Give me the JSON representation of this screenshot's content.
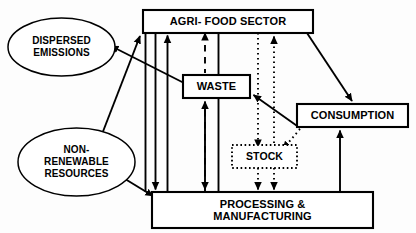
{
  "diagram": {
    "stroke_color": "#000000",
    "fill_color": "#ffffff",
    "nodes": [
      {
        "id": "agri_food",
        "label": "AGRI- FOOD SECTOR",
        "shape": "rect",
        "border": "solid",
        "x": 143,
        "y": 10,
        "w": 170,
        "h": 23
      },
      {
        "id": "waste",
        "label": "WASTE",
        "shape": "rect",
        "border": "solid",
        "x": 183,
        "y": 75,
        "w": 67,
        "h": 23
      },
      {
        "id": "stock",
        "label": "STOCK",
        "shape": "rect",
        "border": "dotted",
        "x": 232,
        "y": 145,
        "w": 65,
        "h": 23
      },
      {
        "id": "consumption",
        "label": "CONSUMPTION",
        "shape": "rect",
        "border": "solid",
        "x": 297,
        "y": 104,
        "w": 111,
        "h": 23
      },
      {
        "id": "processing",
        "label": "PROCESSING &\nMANUFACTURING",
        "shape": "rect",
        "border": "solid",
        "x": 152,
        "y": 192,
        "w": 221,
        "h": 36
      },
      {
        "id": "dispersed",
        "label": "DISPERSED\nEMISSIONS",
        "shape": "ellipse",
        "border": "solid",
        "x": 8,
        "y": 18,
        "w": 107,
        "h": 58
      },
      {
        "id": "nonrenew",
        "label": "NON-\nRENEWABLE\nRESOURCES",
        "shape": "ellipse",
        "border": "solid",
        "x": 18,
        "y": 128,
        "w": 117,
        "h": 68
      }
    ],
    "node_labels": {
      "agri_food": "AGRI- FOOD SECTOR",
      "waste": "WASTE",
      "stock": "STOCK",
      "consumption": "CONSUMPTION",
      "processing_line1": "PROCESSING &",
      "processing_line2": "MANUFACTURING",
      "dispersed_line1": "DISPERSED",
      "dispersed_line2": "EMISSIONS",
      "nonrenew_line1": "NON-",
      "nonrenew_line2": "RENEWABLE",
      "nonrenew_line3": "RESOURCES"
    },
    "edges": [
      {
        "id": "e1",
        "from": "agri_food",
        "to": "waste",
        "style": "solid",
        "arrow": "end"
      },
      {
        "id": "e2",
        "from": "agri_food",
        "to": "consumption",
        "style": "solid",
        "arrow": "end"
      },
      {
        "id": "e3",
        "from": "agri_food",
        "to": "processing",
        "style": "solid",
        "arrow": "end"
      },
      {
        "id": "e4",
        "from": "processing",
        "to": "agri_food",
        "style": "solid",
        "arrow": "end"
      },
      {
        "id": "e5",
        "from": "processing",
        "to": "agri_food",
        "style": "dashed",
        "arrow": "both"
      },
      {
        "id": "e6",
        "from": "waste",
        "to": "processing",
        "style": "dotted",
        "arrow": "end"
      },
      {
        "id": "e7",
        "from": "stock",
        "to": "agri_food",
        "style": "dotted",
        "arrow": "end"
      },
      {
        "id": "e8",
        "from": "processing",
        "to": "waste",
        "style": "solid",
        "arrow": "end"
      },
      {
        "id": "e9",
        "from": "processing",
        "to": "consumption",
        "style": "solid",
        "arrow": "end"
      },
      {
        "id": "e10",
        "from": "consumption",
        "to": "waste",
        "style": "solid",
        "arrow": "end"
      },
      {
        "id": "e11",
        "from": "consumption",
        "to": "stock",
        "style": "dotted",
        "arrow": "end"
      },
      {
        "id": "e12",
        "from": "stock",
        "to": "processing",
        "style": "dotted",
        "arrow": "end"
      },
      {
        "id": "e13",
        "from": "waste",
        "to": "dispersed",
        "style": "solid",
        "arrow": "end"
      },
      {
        "id": "e14",
        "from": "nonrenew",
        "to": "agri_food",
        "style": "solid",
        "arrow": "end"
      },
      {
        "id": "e15",
        "from": "nonrenew",
        "to": "processing",
        "style": "solid",
        "arrow": "end"
      }
    ]
  }
}
